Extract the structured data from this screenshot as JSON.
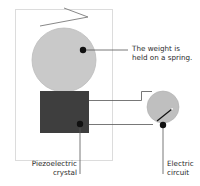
{
  "diagram": {
    "colors": {
      "frame": "#dcdcdc",
      "weight_fill": "#c9c9c9",
      "weight_stroke": "#bdbdbd",
      "crystal": "#3e3e3e",
      "meter_fill": "#bfbfbf",
      "lines": "#555555",
      "dots": "#111111",
      "spring": "#888888"
    },
    "labels": {
      "weight": {
        "line1": "The weight is",
        "line2": "held on a spring."
      },
      "crystal": {
        "line1": "Piezoelectric",
        "line2": "crystal"
      },
      "circuit": {
        "line1": "Electric",
        "line2": "circuit"
      }
    }
  }
}
